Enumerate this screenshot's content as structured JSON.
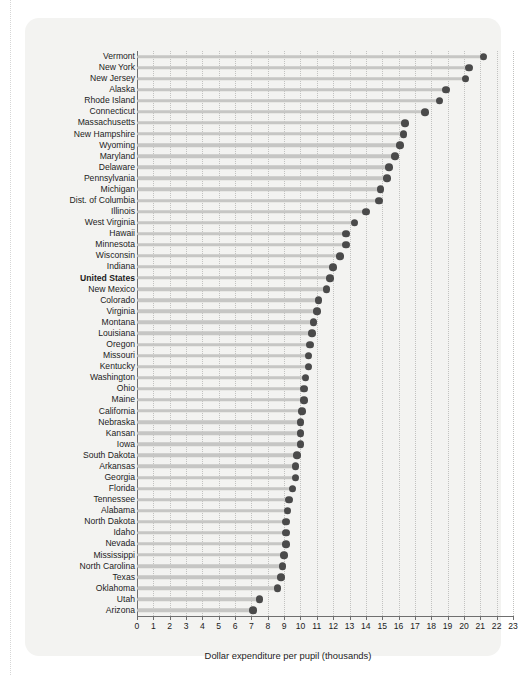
{
  "chart_data": {
    "type": "bar",
    "subtype": "lollipop-dot-plot-horizontal",
    "title": "",
    "subtitle": "",
    "xlabel": "Dollar expenditure per pupil (thousands)",
    "ylabel": "",
    "xlim": [
      0,
      23
    ],
    "xticks": [
      0,
      1,
      2,
      3,
      4,
      5,
      6,
      7,
      8,
      9,
      10,
      11,
      12,
      13,
      14,
      15,
      16,
      17,
      18,
      19,
      20,
      21,
      22,
      23
    ],
    "grid": true,
    "grid_axis": "x",
    "legend": "none",
    "sorted": "descending",
    "highlight_category": "United States",
    "colors": {
      "panel_background": "#f3f3f1",
      "stem": "#c6c6c4",
      "dot": "#4a4a4a",
      "gridline": "#c2c2c0",
      "axis": "#6f6f6f",
      "text": "#1c1c1c"
    },
    "categories": [
      "Vermont",
      "New York",
      "New Jersey",
      "Alaska",
      "Rhode Island",
      "Connecticut",
      "Massachusetts",
      "New Hampshire",
      "Wyoming",
      "Maryland",
      "Delaware",
      "Pennsylvania",
      "Michigan",
      "Dist. of Columbia",
      "Illinois",
      "West Virginia",
      "Hawaii",
      "Minnesota",
      "Wisconsin",
      "Indiana",
      "United States",
      "New Mexico",
      "Colorado",
      "Virginia",
      "Montana",
      "Louisiana",
      "Oregon",
      "Missouri",
      "Kentucky",
      "Washington",
      "Ohio",
      "Maine",
      "California",
      "Nebraska",
      "Kansan",
      "Iowa",
      "South Dakota",
      "Arkansas",
      "Georgia",
      "Florida",
      "Tennessee",
      "Alabama",
      "North Dakota",
      "Idaho",
      "Nevada",
      "Mississippi",
      "North Carolina",
      "Texas",
      "Oklahoma",
      "Utah",
      "Arizona"
    ],
    "values": [
      21.2,
      20.3,
      20.1,
      18.9,
      18.5,
      17.6,
      16.4,
      16.3,
      16.1,
      15.8,
      15.4,
      15.3,
      14.9,
      14.8,
      14.0,
      13.3,
      12.8,
      12.8,
      12.4,
      12.0,
      11.8,
      11.6,
      11.1,
      11.0,
      10.8,
      10.7,
      10.6,
      10.5,
      10.5,
      10.3,
      10.2,
      10.2,
      10.1,
      10.0,
      10.0,
      10.0,
      9.8,
      9.7,
      9.7,
      9.5,
      9.3,
      9.2,
      9.1,
      9.1,
      9.1,
      9.0,
      8.9,
      8.8,
      8.6,
      7.5,
      7.1
    ]
  },
  "axis": {
    "x_title": "Dollar expenditure per pupil (thousands)"
  }
}
